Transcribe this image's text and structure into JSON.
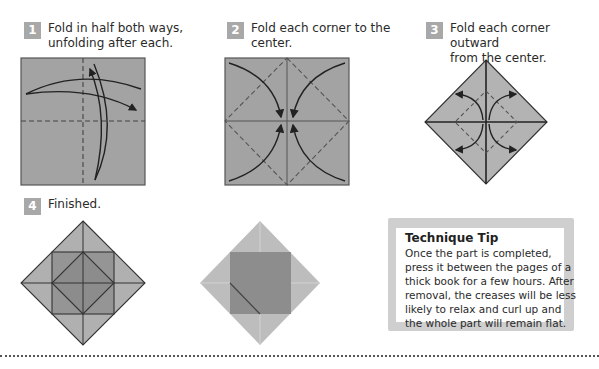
{
  "steps": [
    {
      "number": "1",
      "caption_line1": "Fold in half both ways,",
      "caption_line2": "unfolding after each."
    },
    {
      "number": "2",
      "caption_line1": "Fold each corner to the",
      "caption_line2": "center."
    },
    {
      "number": "3",
      "caption_line1": "Fold each corner outward",
      "caption_line2": "from the center."
    },
    {
      "number": "4",
      "caption_line1": "Finished.",
      "caption_line2": ""
    }
  ],
  "tip": {
    "title": "Technique Tip",
    "body": "Once the part is completed, press it between the pages of a thick book for a few hours. After removal, the creases will be less likely to relax and curl up and the whole part will remain flat."
  },
  "colors": {
    "paper": "#a3a3a3",
    "paper_light": "#b5b5b5",
    "paper_dark": "#8a8a8a",
    "badge": "#a8a8a8",
    "line": "#333333"
  }
}
